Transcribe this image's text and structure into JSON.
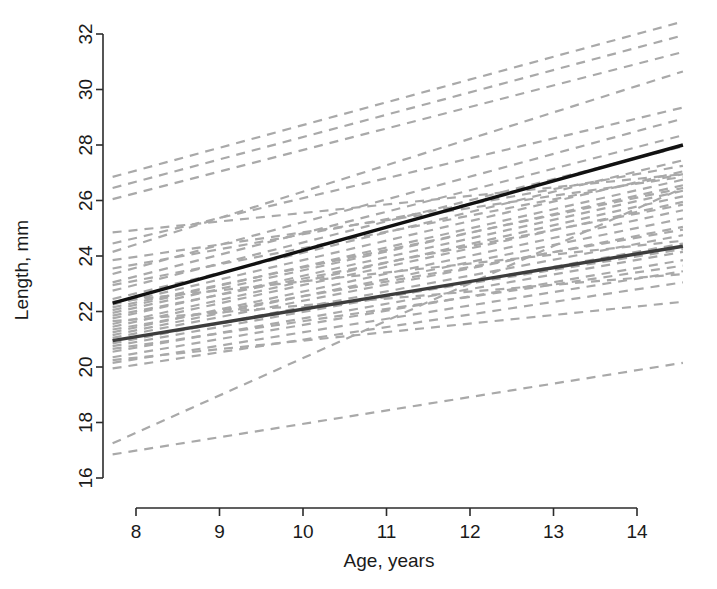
{
  "chart_data": {
    "type": "line",
    "title": "",
    "xlabel": "Age, years",
    "ylabel": "Length, mm",
    "xlim": [
      7.7,
      14.55
    ],
    "ylim": [
      15.6,
      32.4
    ],
    "xticks": [
      8,
      9,
      10,
      11,
      12,
      13,
      14
    ],
    "xticklabels": [
      "8",
      "9",
      "10",
      "11",
      "12",
      "13",
      "14"
    ],
    "yticks": [
      16,
      18,
      20,
      22,
      24,
      26,
      28,
      30,
      32
    ],
    "yticklabels": [
      "16",
      "18",
      "20",
      "22",
      "24",
      "26",
      "28",
      "30",
      "32"
    ],
    "grid": false,
    "legend": "none",
    "colors": {
      "subject_lines": "#a9a9a9",
      "fit_line_upper": "#111111",
      "fit_line_lower": "#3d3d3d",
      "axis": "#2b2b2b",
      "background": "#ffffff"
    },
    "style": {
      "subject_line_dash": "9 7",
      "subject_line_width": 2.2,
      "fit_line_width": 3.4
    },
    "series": [
      {
        "name": "Population average — group 1 (upper)",
        "kind": "fit",
        "color": "#111111",
        "x": [
          7.72,
          14.55
        ],
        "values": [
          22.3,
          28.0
        ]
      },
      {
        "name": "Population average — group 2 (lower)",
        "kind": "fit",
        "color": "#3d3d3d",
        "x": [
          7.72,
          14.55
        ],
        "values": [
          20.95,
          24.35
        ]
      },
      {
        "name": "Subject trajectories",
        "kind": "subject-lines",
        "color": "#a9a9a9",
        "x": [
          7.72,
          14.55
        ],
        "segments": [
          [
            26.85,
            32.45
          ],
          [
            26.05,
            31.35
          ],
          [
            24.15,
            30.65
          ],
          [
            24.45,
            29.35
          ],
          [
            23.35,
            28.95
          ],
          [
            23.05,
            28.35
          ],
          [
            22.75,
            27.95
          ],
          [
            22.45,
            27.45
          ],
          [
            22.25,
            27.05
          ],
          [
            22.05,
            26.75
          ],
          [
            21.95,
            26.55
          ],
          [
            21.75,
            26.35
          ],
          [
            21.55,
            26.15
          ],
          [
            21.45,
            25.95
          ],
          [
            21.25,
            25.65
          ],
          [
            21.15,
            25.35
          ],
          [
            21.05,
            25.05
          ],
          [
            20.85,
            24.75
          ],
          [
            20.75,
            24.45
          ],
          [
            20.55,
            24.15
          ],
          [
            20.35,
            23.85
          ],
          [
            20.15,
            23.45
          ],
          [
            19.95,
            23.05
          ],
          [
            22.95,
            26.95
          ],
          [
            22.15,
            26.45
          ],
          [
            21.85,
            25.85
          ],
          [
            21.35,
            24.95
          ],
          [
            20.95,
            24.25
          ],
          [
            20.65,
            23.65
          ],
          [
            23.85,
            26.85
          ],
          [
            16.85,
            20.15
          ],
          [
            17.25,
            26.45
          ],
          [
            22.35,
            24.55
          ],
          [
            21.65,
            23.35
          ],
          [
            20.25,
            22.35
          ],
          [
            23.55,
            27.25
          ],
          [
            24.85,
            26.95
          ],
          [
            26.45,
            31.95
          ]
        ]
      }
    ]
  },
  "axes": {
    "x_axis_name": "x-axis",
    "y_axis_name": "y-axis"
  }
}
